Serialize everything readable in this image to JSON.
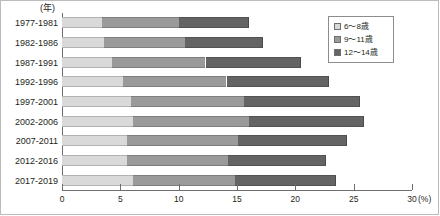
{
  "chart_data": {
    "type": "bar",
    "orientation": "horizontal",
    "stacked": true,
    "title": "",
    "xlabel": "(%)",
    "ylabel": "(年)",
    "grid": false,
    "legend_position": "top-right",
    "xlim": [
      0,
      30
    ],
    "xticks": [
      0,
      5,
      10,
      15,
      20,
      25,
      30
    ],
    "xtick_labels": [
      "0",
      "5",
      "10",
      "15",
      "20",
      "25",
      "30"
    ],
    "x_unit_label": "(%)",
    "y_unit_label": "(年)",
    "categories": [
      "1977-1981",
      "1982-1986",
      "1987-1991",
      "1992-1996",
      "1997-2001",
      "2002-2006",
      "2007-2011",
      "2012-2016",
      "2017-2019"
    ],
    "series": [
      {
        "name": "6～8歳",
        "color": "#d9d9d9",
        "values": [
          3.4,
          3.6,
          4.3,
          5.2,
          5.9,
          6.1,
          5.6,
          5.6,
          6.1
        ]
      },
      {
        "name": "9～11歳",
        "color": "#9a9a9a",
        "values": [
          6.6,
          6.9,
          8.0,
          8.9,
          9.7,
          9.9,
          9.5,
          8.6,
          8.7
        ]
      },
      {
        "name": "12～14歳",
        "color": "#646464",
        "values": [
          6.0,
          6.7,
          8.2,
          8.8,
          9.9,
          9.9,
          9.3,
          8.4,
          8.7
        ]
      }
    ],
    "totals": [
      16.0,
      17.2,
      20.5,
      22.9,
      25.5,
      25.9,
      24.4,
      22.6,
      23.5
    ]
  },
  "legend": {
    "items": [
      {
        "label": "6～8歳"
      },
      {
        "label": "9～11歳"
      },
      {
        "label": "12～14歳"
      }
    ]
  },
  "axis": {
    "y_unit": "(年)",
    "x_unit": "(%)"
  }
}
